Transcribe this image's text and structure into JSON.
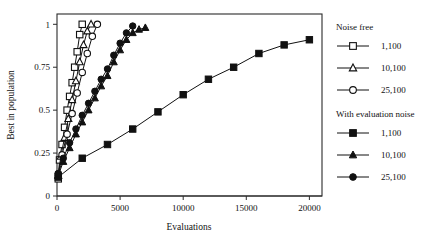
{
  "chart_data": {
    "type": "line",
    "title": "",
    "xlabel": "Evaluations",
    "ylabel": "Best in population",
    "xlim": [
      0,
      21000
    ],
    "ylim": [
      0,
      1.06
    ],
    "xticks": [
      0,
      5000,
      10000,
      15000,
      20000
    ],
    "xticklabels": [
      "0",
      "5000",
      "10000",
      "15000",
      "20000"
    ],
    "yticks": [
      0,
      0.25,
      0.5,
      0.75,
      1
    ],
    "yticklabels": [
      "0",
      "0.25",
      "0.5",
      "0.75",
      "1"
    ],
    "grid": false,
    "legend_position": "right",
    "legend_groups": [
      {
        "heading": "Noise free",
        "entries": [
          {
            "label": "1,100",
            "marker": "open-square",
            "series": "noise_free_1_100"
          },
          {
            "label": "10,100",
            "marker": "open-triangle",
            "series": "noise_free_10_100"
          },
          {
            "label": "25,100",
            "marker": "open-circle",
            "series": "noise_free_25_100"
          }
        ]
      },
      {
        "heading": "With evaluation noise",
        "entries": [
          {
            "label": "1,100",
            "marker": "filled-square",
            "series": "noisy_1_100"
          },
          {
            "label": "10,100",
            "marker": "filled-triangle",
            "series": "noisy_10_100"
          },
          {
            "label": "25,100",
            "marker": "filled-circle",
            "series": "noisy_25_100"
          }
        ]
      }
    ],
    "series": [
      {
        "name": "noise_free_1_100",
        "group": "Noise free",
        "label": "1,100",
        "marker": "open-square",
        "x": [
          100,
          200,
          400,
          600,
          800,
          1000,
          1200,
          1400,
          1600,
          1800,
          2000
        ],
        "y": [
          0.1,
          0.21,
          0.3,
          0.4,
          0.5,
          0.58,
          0.66,
          0.75,
          0.84,
          0.94,
          1.0
        ]
      },
      {
        "name": "noise_free_10_100",
        "group": "Noise free",
        "label": "10,100",
        "marker": "open-triangle",
        "x": [
          100,
          300,
          600,
          900,
          1200,
          1500,
          1800,
          2100,
          2400,
          2700
        ],
        "y": [
          0.12,
          0.23,
          0.34,
          0.45,
          0.56,
          0.67,
          0.78,
          0.88,
          0.96,
          1.0
        ]
      },
      {
        "name": "noise_free_25_100",
        "group": "Noise free",
        "label": "25,100",
        "marker": "open-circle",
        "x": [
          100,
          400,
          800,
          1200,
          1600,
          2000,
          2400,
          2800,
          3200
        ],
        "y": [
          0.13,
          0.24,
          0.36,
          0.48,
          0.6,
          0.72,
          0.83,
          0.93,
          1.0
        ]
      },
      {
        "name": "noisy_1_100",
        "group": "With evaluation noise",
        "label": "1,100",
        "marker": "filled-square",
        "x": [
          100,
          2000,
          4000,
          6000,
          8000,
          10000,
          12000,
          14000,
          16000,
          18000,
          20000
        ],
        "y": [
          0.11,
          0.22,
          0.3,
          0.39,
          0.49,
          0.59,
          0.68,
          0.75,
          0.83,
          0.88,
          0.91
        ]
      },
      {
        "name": "noisy_10_100",
        "group": "With evaluation noise",
        "label": "10,100",
        "marker": "filled-triangle",
        "x": [
          100,
          500,
          1000,
          1500,
          2000,
          2500,
          3000,
          3500,
          4000,
          4500,
          5000,
          5500,
          6000,
          6500,
          7000
        ],
        "y": [
          0.12,
          0.2,
          0.28,
          0.36,
          0.43,
          0.5,
          0.57,
          0.64,
          0.7,
          0.78,
          0.85,
          0.91,
          0.95,
          0.97,
          0.98
        ]
      },
      {
        "name": "noisy_25_100",
        "group": "With evaluation noise",
        "label": "25,100",
        "marker": "filled-circle",
        "x": [
          100,
          500,
          1000,
          1500,
          2000,
          2500,
          3000,
          3500,
          4000,
          4500,
          5000,
          5500,
          6000
        ],
        "y": [
          0.13,
          0.22,
          0.31,
          0.39,
          0.47,
          0.54,
          0.61,
          0.68,
          0.74,
          0.82,
          0.89,
          0.95,
          0.99
        ]
      }
    ]
  }
}
